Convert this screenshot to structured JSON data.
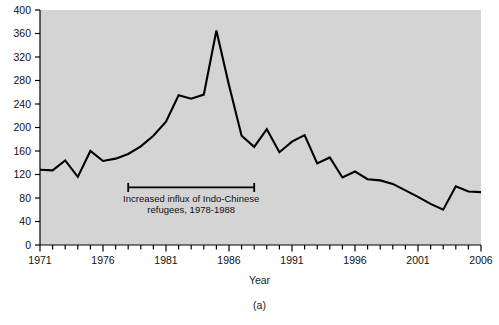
{
  "figure": {
    "caption": "(a)",
    "panel_bg": "#d4d4d4",
    "page_bg": "#ffffff",
    "line_color": "#000000",
    "axis_color": "#000000"
  },
  "chart_data": {
    "type": "line",
    "title": "",
    "xlabel": "Year",
    "ylabel": "Reported cases",
    "xlim": [
      1971,
      2006
    ],
    "ylim": [
      0,
      400
    ],
    "grid": false,
    "legend": null,
    "ytick_labels": [
      "0",
      "40",
      "80",
      "120",
      "160",
      "200",
      "240",
      "280",
      "320",
      "360",
      "400"
    ],
    "ytick_values": [
      0,
      40,
      80,
      120,
      160,
      200,
      240,
      280,
      320,
      360,
      400
    ],
    "xtick_labels": [
      "1971",
      "1976",
      "1981",
      "1986",
      "1991",
      "1996",
      "2001",
      "2006"
    ],
    "xtick_values": [
      1971,
      1976,
      1981,
      1986,
      1991,
      1996,
      2001,
      2006
    ],
    "xtick_minor_step": 1,
    "x": [
      1971,
      1972,
      1973,
      1974,
      1975,
      1976,
      1977,
      1978,
      1979,
      1980,
      1981,
      1982,
      1983,
      1984,
      1985,
      1986,
      1987,
      1988,
      1989,
      1990,
      1991,
      1992,
      1993,
      1994,
      1995,
      1996,
      1997,
      1998,
      1999,
      2000,
      2001,
      2002,
      2003,
      2004,
      2005,
      2006
    ],
    "values": [
      128,
      127,
      144,
      116,
      160,
      143,
      147,
      155,
      168,
      186,
      210,
      255,
      249,
      256,
      365,
      272,
      186,
      167,
      197,
      158,
      176,
      187,
      139,
      149,
      115,
      125,
      112,
      110,
      104,
      93,
      82,
      70,
      60,
      100,
      91,
      90
    ],
    "series": [
      {
        "name": "Reported cases",
        "values": [
          128,
          127,
          144,
          116,
          160,
          143,
          147,
          155,
          168,
          186,
          210,
          255,
          249,
          256,
          365,
          272,
          186,
          167,
          197,
          158,
          176,
          187,
          139,
          149,
          115,
          125,
          112,
          110,
          104,
          93,
          82,
          70,
          60,
          100,
          91,
          90
        ]
      }
    ],
    "annotations": [
      {
        "name": "indo-chinese-refugee-bracket",
        "text_line1": "Increased influx of Indo-Chinese",
        "text_line2": "refugees, 1978-1988",
        "x_start": 1978,
        "x_end": 1988,
        "y": 98
      }
    ]
  }
}
